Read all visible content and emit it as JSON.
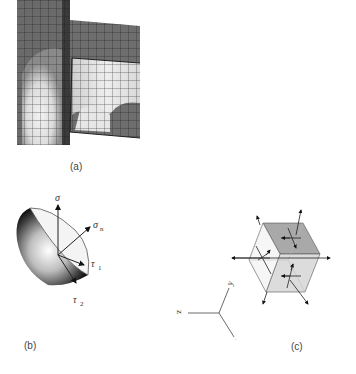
{
  "figure": {
    "panels": [
      {
        "id": "a",
        "caption": "(a)",
        "description": "Finite element mesh contour plot of a beam-column joint showing stress distribution (grayscale)"
      },
      {
        "id": "b",
        "caption": "(b)",
        "description": "Hemispherical surface element with normal and shear stress vectors",
        "labels": {
          "sigma": "σ",
          "sigma_n": "σ",
          "sigma_n_sub": "n",
          "tau1": "τ",
          "tau1_sub": "1",
          "tau2": "τ",
          "tau2_sub": "2"
        }
      },
      {
        "id": "c",
        "caption": "(c)",
        "description": "Cubic stress element with normal and shear stress arrows on faces, with x-y-z coordinate axes",
        "axes": {
          "x": "x",
          "y": "y",
          "z": "z"
        }
      }
    ]
  }
}
